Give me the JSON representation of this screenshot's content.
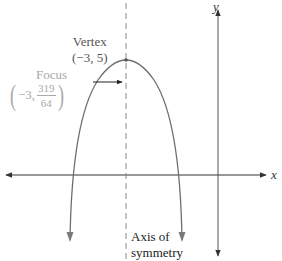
{
  "diagram": {
    "type": "parabola-graph",
    "axes": {
      "x_label": "x",
      "y_label": "y"
    },
    "vertex": {
      "label": "Vertex",
      "coordinates": "(−3, 5)"
    },
    "focus": {
      "label": "Focus",
      "x": "−3,",
      "y_numerator": "319",
      "y_denominator": "64",
      "paren_open": "(",
      "paren_close": ")"
    },
    "axis_of_symmetry": {
      "line1": "Axis of",
      "line2": "symmetry"
    },
    "colors": {
      "axes": "#333333",
      "parabola": "#6e6e6e",
      "axis_of_symmetry": "#888888",
      "focus_text": "#a8a8a8",
      "vertex_text": "#555555"
    }
  }
}
